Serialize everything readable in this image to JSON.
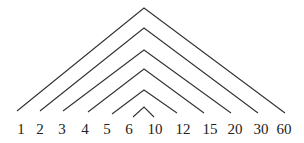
{
  "diagram": {
    "number": 60,
    "labels": [
      "1",
      "2",
      "3",
      "4",
      "5",
      "6",
      "10",
      "12",
      "15",
      "20",
      "30",
      "60"
    ],
    "pairs": [
      {
        "left": "1",
        "right": "60"
      },
      {
        "left": "2",
        "right": "30"
      },
      {
        "left": "3",
        "right": "20"
      },
      {
        "left": "4",
        "right": "15"
      },
      {
        "left": "5",
        "right": "12"
      },
      {
        "left": "6",
        "right": "10"
      }
    ],
    "colors": {
      "line": "#333333",
      "text": "#222222",
      "background": "#ffffff"
    }
  }
}
